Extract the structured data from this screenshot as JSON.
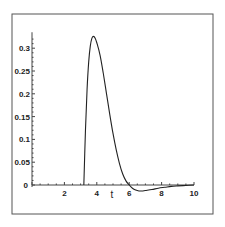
{
  "chart_data": {
    "type": "line",
    "title": "",
    "xlabel": "t",
    "ylabel": "",
    "xlim": [
      0,
      10
    ],
    "ylim": [
      -0.015,
      0.33
    ],
    "grid": false,
    "legend": null,
    "x_ticks": [
      "0",
      "2",
      "4",
      "6",
      "8",
      "10"
    ],
    "y_ticks": [
      "0",
      "0.05",
      "0.1",
      "0.15",
      "0.2",
      "0.25",
      "0.3"
    ],
    "series": [
      {
        "name": "curve",
        "color": "#222222",
        "x": [
          3.2,
          3.3,
          3.4,
          3.5,
          3.6,
          3.7,
          3.8,
          3.9,
          4.0,
          4.2,
          4.4,
          4.6,
          4.8,
          5.0,
          5.2,
          5.4,
          5.6,
          5.8,
          6.0,
          6.2,
          6.4,
          6.6,
          6.8,
          7.0,
          7.4,
          7.8,
          8.2,
          8.6,
          9.0,
          9.5,
          10.0
        ],
        "values": [
          0.0,
          0.12,
          0.21,
          0.27,
          0.305,
          0.322,
          0.326,
          0.322,
          0.312,
          0.285,
          0.245,
          0.2,
          0.155,
          0.113,
          0.077,
          0.047,
          0.024,
          0.009,
          0.0,
          -0.007,
          -0.011,
          -0.013,
          -0.013,
          -0.012,
          -0.01,
          -0.007,
          -0.005,
          -0.003,
          -0.002,
          -0.001,
          0.0
        ]
      }
    ]
  },
  "axes": {
    "x_label": "t",
    "x_ticks": [
      {
        "value": 0,
        "label": "0"
      },
      {
        "value": 2,
        "label": "2"
      },
      {
        "value": 4,
        "label": "4"
      },
      {
        "value": 6,
        "label": "6"
      },
      {
        "value": 8,
        "label": "8"
      },
      {
        "value": 10,
        "label": "10"
      }
    ],
    "y_ticks": [
      {
        "value": 0.05,
        "label": "0.05"
      },
      {
        "value": 0.1,
        "label": "0.1"
      },
      {
        "value": 0.15,
        "label": "0.15"
      },
      {
        "value": 0.2,
        "label": "0.2"
      },
      {
        "value": 0.25,
        "label": "0.25"
      },
      {
        "value": 0.3,
        "label": "0.3"
      }
    ]
  }
}
